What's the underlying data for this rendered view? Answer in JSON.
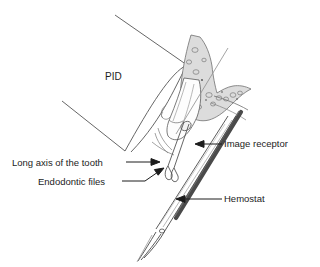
{
  "figure": {
    "type": "dental-radiography-technique-illustration",
    "background_color": "#ffffff",
    "line_color": "#3a3a3a",
    "bone_fill_color": "#d8d8d8",
    "receptor_color": "#4a4a4a",
    "text_color": "#1c1c1c"
  },
  "labels": {
    "pid": "PID",
    "long_axis_of_tooth": "Long axis of the tooth",
    "endodontic_files": "Endodontic files",
    "image_receptor": "Image receptor",
    "hemostat": "Hemostat"
  },
  "parts": [
    {
      "name": "pid",
      "label": "PID",
      "description": "position-indicating device cone"
    },
    {
      "name": "long-axis-of-the-tooth",
      "label": "Long axis of the tooth",
      "description": "reference axis line through tooth"
    },
    {
      "name": "endodontic-files",
      "label": "Endodontic files",
      "description": "files inserted in root canals"
    },
    {
      "name": "image-receptor",
      "label": "Image receptor",
      "description": "intraoral film or sensor"
    },
    {
      "name": "hemostat",
      "label": "Hemostat",
      "description": "instrument holding the receptor"
    },
    {
      "name": "alveolar-bone",
      "label": "",
      "description": "shaded trabecular bone"
    },
    {
      "name": "tooth",
      "label": "",
      "description": "molar tooth with roots"
    }
  ]
}
